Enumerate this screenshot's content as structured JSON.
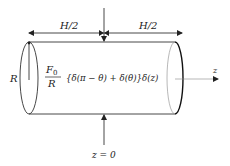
{
  "diagram": {
    "labels": {
      "half_length_left": "H/2",
      "half_length_right": "H/2",
      "radius": "R",
      "axis": "z",
      "origin": "z = 0"
    },
    "formula": {
      "numerator": "F",
      "numerator_subscript": "0",
      "denominator": "R",
      "expression": "{δ(π − θ) + δ(θ)}δ(z)"
    },
    "colors": {
      "line": "#333333",
      "background": "#ffffff"
    }
  }
}
